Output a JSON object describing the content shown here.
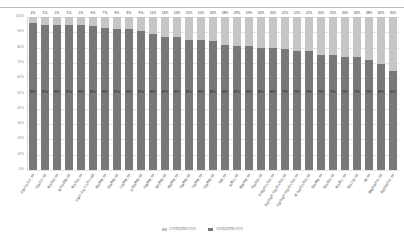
{
  "chart_data": {
    "type": "bar",
    "subtype": "100% stacked bar",
    "title": "",
    "xlabel": "",
    "ylabel": "",
    "ylim": [
      0,
      100
    ],
    "yticks": [
      "0%",
      "10%",
      "20%",
      "30%",
      "40%",
      "50%",
      "60%",
      "70%",
      "80%",
      "90%",
      "100%"
    ],
    "grid": true,
    "legend_position": "bottom",
    "legend": [
      "女性教員等数の割合",
      "男性教員等数の割合"
    ],
    "categories": [
      "お茶の水女子大学",
      "奈良女子大学",
      "東京芸術大学",
      "東京外国語大学",
      "東京学芸大学",
      "お茶の水女子大学大学院",
      "愛知教育大学",
      "宮城教育大学",
      "上越教育大学",
      "北海道教育大学",
      "兵庫教育大学",
      "鳴門教育大学",
      "福岡教育大学",
      "京都教育大学",
      "大阪教育大学",
      "奈良教育大学",
      "滋賀大学",
      "和歌山大学",
      "鹿屋体育大学",
      "筑波技術大学",
      "政策研究大学院大学",
      "北陸先端科学技術大学院大学",
      "奈良先端科学技術大学院大学",
      "総合研究大学院大学",
      "電気通信大学",
      "東京海洋大学",
      "東京農工大学",
      "東京工業大学",
      "一橋大学",
      "豊橋技術科学大学",
      "長岡技術科学大学"
    ],
    "series": [
      {
        "name": "女性教員等数の割合",
        "color": "#c6c6c6",
        "values": [
          4,
          5,
          5,
          5,
          5,
          6,
          7,
          8,
          8,
          9,
          11,
          13,
          13,
          15,
          15,
          16,
          18,
          19,
          19,
          20,
          20,
          21,
          22,
          22,
          25,
          25,
          26,
          26,
          28,
          31,
          35
        ]
      },
      {
        "name": "男性教員等数の割合",
        "color": "#787878",
        "values": [
          96,
          95,
          95,
          95,
          95,
          94,
          93,
          92,
          92,
          91,
          89,
          87,
          87,
          85,
          85,
          84,
          82,
          81,
          81,
          80,
          80,
          79,
          78,
          78,
          75,
          75,
          74,
          74,
          72,
          69,
          65
        ]
      }
    ],
    "top_labels": [
      "4%",
      "5%",
      "5%",
      "5%",
      "5%",
      "6%",
      "7%",
      "8%",
      "8%",
      "9%",
      "11%",
      "13%",
      "13%",
      "15%",
      "15%",
      "16%",
      "18%",
      "19%",
      "19%",
      "20%",
      "20%",
      "21%",
      "22%",
      "22%",
      "25%",
      "25%",
      "26%",
      "26%",
      "28%",
      "31%",
      "35%"
    ],
    "mid_labels": [
      "96%",
      "95%",
      "95%",
      "95%",
      "95%",
      "94%",
      "93%",
      "92%",
      "92%",
      "91%",
      "89%",
      "87%",
      "87%",
      "85%",
      "85%",
      "84%",
      "82%",
      "81%",
      "81%",
      "80%",
      "80%",
      "79%",
      "78%",
      "78%",
      "75%",
      "75%",
      "74%",
      "74%",
      "72%",
      "69%",
      "65%"
    ]
  }
}
